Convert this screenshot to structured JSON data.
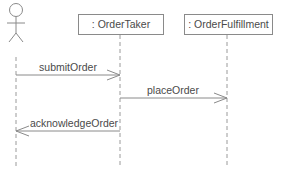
{
  "diagram": {
    "type": "sequence",
    "colors": {
      "line": "#8a8a8a",
      "lifeline": "#9a9a9a",
      "text": "#4a4a4a",
      "box_border": "#8a8a8a",
      "background": "#ffffff"
    },
    "actor": {
      "name": "",
      "icon": "stick-figure-icon"
    },
    "objects": [
      {
        "id": "order-taker",
        "label": ": OrderTaker"
      },
      {
        "id": "order-fulfillment",
        "label": ": OrderFulfillment"
      }
    ],
    "messages": [
      {
        "label": "submitOrder",
        "from": "actor",
        "to": "order-taker"
      },
      {
        "label": "placeOrder",
        "from": "order-taker",
        "to": "order-fulfillment"
      },
      {
        "label": "acknowledgeOrder",
        "from": "order-taker",
        "to": "actor"
      }
    ]
  }
}
